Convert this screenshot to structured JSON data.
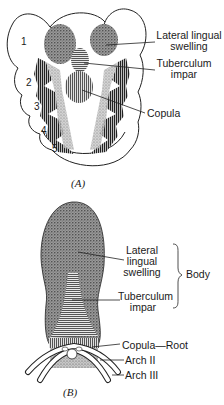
{
  "figure_a": {
    "caption": "(A)",
    "arch_numbers": [
      "1",
      "2",
      "3",
      "4",
      "5"
    ],
    "labels": {
      "lateral_lingual_swelling_line1": "Lateral lingual",
      "lateral_lingual_swelling_line2": "swelling",
      "tuberculum_impar_line1": "Tuberculum",
      "tuberculum_impar_line2": "impar",
      "copula": "Copula"
    }
  },
  "figure_b": {
    "caption": "(B)",
    "labels": {
      "lateral_line1": "Lateral",
      "lateral_line2": "lingual",
      "lateral_line3": "swelling",
      "tuberculum_line1": "Tuberculum",
      "tuberculum_line2": "impar",
      "body": "Body",
      "copula_root": "Copula—Root",
      "arch_ii": "Arch II",
      "arch_iii": "Arch III"
    }
  }
}
